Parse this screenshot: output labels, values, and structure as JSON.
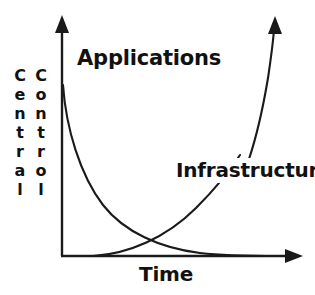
{
  "diagram": {
    "labels": {
      "applications": "Applications",
      "infrastructure": "Infrastructure",
      "x_axis": "Time",
      "y_axis": "Central Control",
      "y_axis_word_1": "Central",
      "y_axis_word_2": "Control"
    },
    "colors": {
      "stroke": "#1a1a1a",
      "text": "#111111",
      "background": "#ffffff"
    }
  },
  "chart_data": {
    "type": "line",
    "title": "",
    "xlabel": "Time",
    "ylabel": "Central Control",
    "grid": false,
    "legend": "inline-annotations",
    "axis_arrows": {
      "x": true,
      "y": true
    },
    "xlim": [
      0,
      100
    ],
    "ylim": [
      0,
      100
    ],
    "tick_labels": {
      "x": [],
      "y": []
    },
    "series": [
      {
        "name": "Applications",
        "shape": "exponential-decay",
        "annotation": "Applications",
        "arrow_end": false,
        "points": [
          {
            "x": 1,
            "y": 98
          },
          {
            "x": 6,
            "y": 72
          },
          {
            "x": 12,
            "y": 54
          },
          {
            "x": 20,
            "y": 38
          },
          {
            "x": 30,
            "y": 25
          },
          {
            "x": 42,
            "y": 15
          },
          {
            "x": 55,
            "y": 9
          },
          {
            "x": 70,
            "y": 4
          },
          {
            "x": 85,
            "y": 1
          },
          {
            "x": 100,
            "y": 0
          }
        ]
      },
      {
        "name": "Infrastructure",
        "shape": "exponential-growth",
        "annotation": "Infrastructure",
        "arrow_end": true,
        "points": [
          {
            "x": 14,
            "y": 0
          },
          {
            "x": 30,
            "y": 3
          },
          {
            "x": 45,
            "y": 9
          },
          {
            "x": 58,
            "y": 18
          },
          {
            "x": 68,
            "y": 29
          },
          {
            "x": 76,
            "y": 44
          },
          {
            "x": 82,
            "y": 60
          },
          {
            "x": 86,
            "y": 76
          },
          {
            "x": 89,
            "y": 92
          },
          {
            "x": 90,
            "y": 100
          }
        ]
      }
    ],
    "crossover": {
      "x": 40,
      "y": 16,
      "note": "curves intersect near lower-left of plot"
    }
  }
}
